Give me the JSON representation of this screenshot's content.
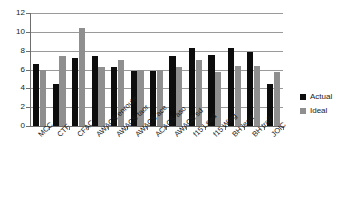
{
  "chart_data": {
    "type": "bar",
    "title": "",
    "subtitle": "",
    "xlabel": "",
    "ylabel": "",
    "ylim": [
      0,
      12
    ],
    "ytick_step": 2,
    "yticks": [
      0,
      2,
      4,
      6,
      8,
      10,
      12
    ],
    "grid": "horizontal",
    "legend_position": "right",
    "categories": [
      "MCC",
      "CTF",
      "CFAC",
      "AWACS enroute",
      "AWACS taor",
      "AWACS ace",
      "ACACS aso",
      "AWACS sd",
      "f15 Lead",
      "f15 Wing",
      "BH lead",
      "BH trail",
      "JOIC"
    ],
    "series": [
      {
        "name": "Actual",
        "color": "#0d0d0d",
        "values": [
          6.6,
          4.5,
          7.2,
          7.45,
          6.3,
          5.85,
          5.85,
          7.45,
          8.3,
          7.5,
          8.3,
          7.9,
          4.5
        ]
      },
      {
        "name": "Ideal",
        "color": "#8f8f8f",
        "values": [
          6.0,
          7.4,
          10.45,
          6.3,
          7.0,
          5.9,
          5.9,
          6.3,
          7.0,
          5.7,
          6.35,
          6.35,
          5.7
        ]
      }
    ]
  }
}
